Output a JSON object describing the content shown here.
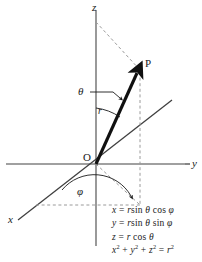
{
  "figure": {
    "colors": {
      "axis": "#808080",
      "vector": "#101010",
      "dashed": "#9a9a9a",
      "text": "#1a1a1a",
      "background": "#ffffff"
    }
  },
  "axes": {
    "z_label": "z",
    "y_label": "y",
    "x_label": "x"
  },
  "points": {
    "origin_label": "O",
    "point_label": "P"
  },
  "annotations": {
    "radius_label": "r",
    "theta_label": "θ",
    "phi_label": "φ"
  },
  "equations": {
    "lines": [
      "x = r sin θ cos φ",
      "y = r sin θ sin φ",
      "z = r cos θ",
      "x² + y² + z² = r²"
    ],
    "x_var": "x",
    "y_var": "y",
    "z_var": "z",
    "r_var": "r",
    "eq_sign": "=",
    "sin_fn": "sin",
    "cos_fn": "cos",
    "theta": "θ",
    "phi": "φ",
    "plus": "+",
    "exponent": "2"
  }
}
